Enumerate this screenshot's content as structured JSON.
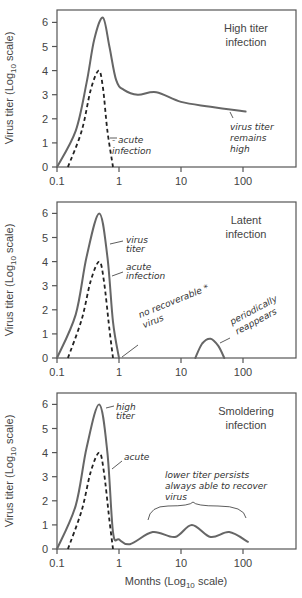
{
  "chart_data": [
    {
      "type": "line",
      "title": "High titer infection",
      "title_lines": [
        "High titer",
        "infection"
      ],
      "xlabel": "",
      "ylabel": "Virus titer (Log10 scale)",
      "xscale": "log",
      "xlim": [
        0.1,
        1000
      ],
      "ylim": [
        0,
        6.5
      ],
      "xticks": [
        "0.1",
        "1",
        "10",
        "100"
      ],
      "yticks": [
        "0",
        "1",
        "2",
        "3",
        "4",
        "5",
        "6"
      ],
      "grid": false,
      "series": [
        {
          "name": "Virus titer",
          "style": "solid",
          "x": [
            0.1,
            0.2,
            0.3,
            0.4,
            0.55,
            0.7,
            0.9,
            1.2,
            2,
            4,
            10,
            30,
            110
          ],
          "y": [
            0,
            1.5,
            3.5,
            5.3,
            6.2,
            5.0,
            3.6,
            3.2,
            3.0,
            3.1,
            2.7,
            2.5,
            2.3
          ]
        },
        {
          "name": "Acute infection",
          "style": "dashed",
          "x": [
            0.15,
            0.25,
            0.35,
            0.47,
            0.55,
            0.65,
            0.8
          ],
          "y": [
            0,
            1.5,
            3.2,
            4.0,
            3.3,
            1.5,
            0
          ]
        }
      ],
      "annotations": [
        {
          "text": "acute infection",
          "lines": [
            "- acute",
            "infection"
          ]
        },
        {
          "text": "virus titer remains high",
          "lines": [
            "virus titer",
            "remains",
            "high"
          ]
        }
      ]
    },
    {
      "type": "line",
      "title": "Latent infection",
      "title_lines": [
        "Latent",
        "infection"
      ],
      "xlabel": "",
      "ylabel": "Virus titer (Log10 scale)",
      "xscale": "log",
      "xlim": [
        0.1,
        1000
      ],
      "ylim": [
        0,
        6.5
      ],
      "xticks": [
        "0.1",
        "1",
        "10",
        "100"
      ],
      "yticks": [
        "0",
        "1",
        "2",
        "3",
        "4",
        "5",
        "6"
      ],
      "grid": false,
      "series": [
        {
          "name": "Virus titer",
          "style": "solid",
          "x": [
            0.1,
            0.2,
            0.3,
            0.48,
            0.65,
            0.8,
            1.0
          ],
          "y": [
            0,
            1.8,
            4.2,
            6.0,
            4.2,
            1.5,
            0
          ]
        },
        {
          "name": "Reappearance",
          "style": "solid",
          "x": [
            17,
            22,
            30,
            40,
            50
          ],
          "y": [
            0,
            0.6,
            0.8,
            0.5,
            0
          ]
        },
        {
          "name": "Acute infection",
          "style": "dashed",
          "x": [
            0.15,
            0.25,
            0.35,
            0.48,
            0.57,
            0.7,
            0.8
          ],
          "y": [
            0,
            1.6,
            3.2,
            4.0,
            3.2,
            1.2,
            0
          ]
        }
      ],
      "annotations": [
        {
          "text": "virus titer",
          "lines": [
            "virus",
            "titer"
          ]
        },
        {
          "text": "acute infection",
          "lines": [
            "acute",
            "infection"
          ]
        },
        {
          "text": "no recoverable virus *",
          "lines": [
            "no recoverable *",
            "virus"
          ]
        },
        {
          "text": "periodically reappears",
          "lines": [
            "periodically",
            "reappears"
          ]
        }
      ]
    },
    {
      "type": "line",
      "title": "Smoldering infection",
      "title_lines": [
        "Smoldering",
        "infection"
      ],
      "xlabel": "Months (Log10 scale)",
      "ylabel": "Virus titer (Log10 scale)",
      "xscale": "log",
      "xlim": [
        0.1,
        1000
      ],
      "ylim": [
        0,
        6.5
      ],
      "xticks": [
        "0.1",
        "1",
        "10",
        "100"
      ],
      "yticks": [
        "0",
        "1",
        "2",
        "3",
        "4",
        "5",
        "6"
      ],
      "grid": false,
      "series": [
        {
          "name": "Virus titer",
          "style": "solid",
          "x": [
            0.1,
            0.2,
            0.3,
            0.48,
            0.65,
            0.8,
            1.0,
            1.5,
            3.5,
            8,
            15,
            30,
            60,
            120
          ],
          "y": [
            0,
            1.8,
            4.2,
            6.0,
            4.0,
            0.7,
            0.4,
            0.2,
            0.7,
            0.5,
            1.0,
            0.5,
            0.7,
            0.3
          ]
        },
        {
          "name": "Acute infection",
          "style": "dashed",
          "x": [
            0.15,
            0.25,
            0.35,
            0.48,
            0.57,
            0.7,
            0.8
          ],
          "y": [
            0,
            1.6,
            3.2,
            4.0,
            3.2,
            1.2,
            0
          ]
        }
      ],
      "annotations": [
        {
          "text": "high titer",
          "lines": [
            "high",
            "titer"
          ]
        },
        {
          "text": "acute",
          "lines": [
            "acute"
          ]
        },
        {
          "text": "lower titer persists always able to recover virus",
          "lines": [
            "lower titer persists",
            "always able to recover",
            "virus"
          ]
        }
      ]
    }
  ],
  "labels": {
    "ylabel_prefix": "Virus titer (Log",
    "ylabel_sub": "10",
    "ylabel_suffix": " scale)",
    "xlabel_prefix": "Months (Log",
    "xlabel_sub": "10",
    "xlabel_suffix": " scale)"
  }
}
